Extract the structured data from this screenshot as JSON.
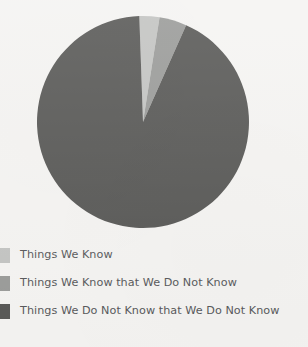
{
  "page": {
    "background_color": "#f5f4f2",
    "text_color": "#57585a"
  },
  "chart_data": {
    "type": "pie",
    "title": "",
    "subtitle": "",
    "xlabel": "",
    "ylabel": "",
    "legend_position": "bottom-left",
    "start_angle_deg": -2,
    "direction": "clockwise",
    "categories": [
      "Things We Know",
      "Things We Know that We Do Not Know",
      "Things We Do Not Know that We Do Not Know"
    ],
    "values": [
      3,
      4,
      93
    ],
    "colors": [
      "#c3c4c2",
      "#9a9b99",
      "#585856"
    ],
    "slices": [
      {
        "label": "Things We Know",
        "value": 3,
        "color": "#c3c4c2",
        "start_angle_deg": -2,
        "end_angle_deg": 9
      },
      {
        "label": "Things We Know that We Do Not Know",
        "value": 4,
        "color": "#9a9b99",
        "start_angle_deg": 9,
        "end_angle_deg": 24
      },
      {
        "label": "Things We Do Not Know that We Do Not Know",
        "value": 93,
        "color": "#585856",
        "start_angle_deg": 24,
        "end_angle_deg": 358
      }
    ]
  },
  "pie": {
    "center_x": 143,
    "center_y": 122,
    "radius": 106
  },
  "legend": {
    "items": [
      {
        "label": "Things We Know",
        "color": "#c3c4c2",
        "swatch_name": "legend-swatch-things-we-know"
      },
      {
        "label": "Things We Know that We Do Not Know",
        "color": "#9a9b99",
        "swatch_name": "legend-swatch-things-we-know-that-we-do-not-know"
      },
      {
        "label": "Things We Do Not Know that We Do Not Know",
        "color": "#585856",
        "swatch_name": "legend-swatch-things-we-do-not-know-that-we-do-not-know"
      }
    ]
  }
}
